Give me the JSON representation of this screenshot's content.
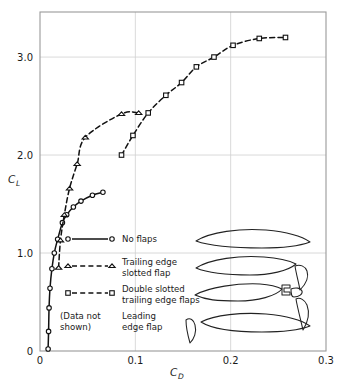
{
  "chart_data": {
    "type": "line",
    "title": "",
    "xlabel": "C_D",
    "ylabel": "C_L",
    "xlabel_main": "C",
    "xlabel_sub": "D",
    "ylabel_main": "C",
    "ylabel_sub": "L",
    "xlim": [
      0,
      0.3
    ],
    "ylim": [
      0,
      3.46
    ],
    "xticks": [
      0,
      0.1,
      0.2,
      0.3
    ],
    "xticklabels": [
      "0",
      "0.1",
      "0.2",
      "0.3"
    ],
    "yticks": [
      0,
      1.0,
      2.0,
      3.0
    ],
    "yticklabels": [
      "0",
      "1.0",
      "2.0",
      "3.0"
    ],
    "grid": true,
    "legend_position": "inside-lower-left",
    "series": [
      {
        "name": "No flaps",
        "marker": "circle",
        "linestyle": "solid",
        "points": [
          [
            0.0085,
            0.02
          ],
          [
            0.009,
            0.2
          ],
          [
            0.0095,
            0.44
          ],
          [
            0.0105,
            0.64
          ],
          [
            0.0125,
            0.84
          ],
          [
            0.015,
            1.0
          ],
          [
            0.0185,
            1.14
          ],
          [
            0.0235,
            1.31
          ],
          [
            0.028,
            1.39
          ],
          [
            0.035,
            1.47
          ],
          [
            0.043,
            1.53
          ],
          [
            0.055,
            1.59
          ],
          [
            0.066,
            1.62
          ]
        ]
      },
      {
        "name": "Trailing edge slotted flap",
        "marker": "triangle",
        "linestyle": "dashed",
        "points": [
          [
            0.0195,
            0.85
          ],
          [
            0.0215,
            1.13
          ],
          [
            0.0255,
            1.39
          ],
          [
            0.031,
            1.66
          ],
          [
            0.039,
            1.91
          ],
          [
            0.0475,
            2.18
          ],
          [
            0.0855,
            2.42
          ],
          [
            0.1035,
            2.43
          ]
        ]
      },
      {
        "name": "Double slotted trailing edge flaps",
        "marker": "square",
        "linestyle": "dashed",
        "points": [
          [
            0.0855,
            2.0
          ],
          [
            0.0975,
            2.2
          ],
          [
            0.1135,
            2.43
          ],
          [
            0.132,
            2.61
          ],
          [
            0.1485,
            2.74
          ],
          [
            0.164,
            2.9
          ],
          [
            0.1825,
            3.0
          ],
          [
            0.2025,
            3.12
          ],
          [
            0.23,
            3.19
          ],
          [
            0.2575,
            3.2
          ]
        ]
      }
    ]
  },
  "legend": {
    "entries": [
      {
        "marker": "circle",
        "linestyle": "solid",
        "line1": "No flaps",
        "line2": "",
        "note": ""
      },
      {
        "marker": "triangle",
        "linestyle": "dashed",
        "line1": "Trailing edge",
        "line2": "slotted flap",
        "note": ""
      },
      {
        "marker": "square",
        "linestyle": "dashed",
        "line1": "Double slotted",
        "line2": "trailing edge flaps",
        "note": ""
      },
      {
        "marker": "none",
        "linestyle": "none",
        "line1": "Leading",
        "line2": "edge flap",
        "note_line1": "(Data not",
        "note_line2": "shown)"
      }
    ]
  },
  "airfoils": [
    {
      "name": "plain-airfoil",
      "label": "No flaps"
    },
    {
      "name": "airfoil-trailing-edge-slotted",
      "label": "Trailing edge slotted flap"
    },
    {
      "name": "airfoil-double-slotted",
      "label": "Double slotted trailing edge flaps"
    },
    {
      "name": "airfoil-leading-edge-flap",
      "label": "Leading edge flap"
    }
  ],
  "colors": {
    "ink": "#111111",
    "frame": "#9a9a9a",
    "grid": "#cfcfcf",
    "background": "#ffffff"
  }
}
